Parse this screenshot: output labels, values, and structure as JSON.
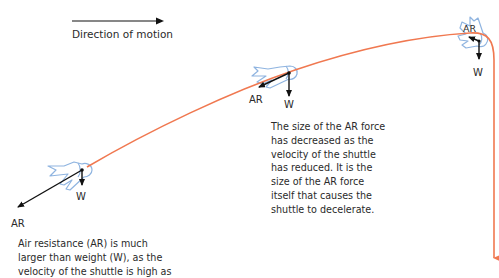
{
  "legend": {
    "direction_label": "Direction of motion"
  },
  "colors": {
    "trajectory": "#f07850",
    "shuttle_outline": "#8fb4e0",
    "force_arrow": "#111111",
    "text": "#2a2a2a"
  },
  "shuttles": [
    {
      "position": "start",
      "ar_label": "AR",
      "w_label": "W",
      "ar_size": "large"
    },
    {
      "position": "middle",
      "ar_label": "AR",
      "w_label": "W",
      "ar_size": "medium"
    },
    {
      "position": "apex",
      "ar_label": "AR",
      "w_label": "W",
      "ar_size": "small"
    }
  ],
  "annotations": {
    "middle": {
      "lines": [
        "The size of the AR force",
        "has decreased as the",
        "velocity of the shuttle",
        "has reduced. It is the",
        "size of the AR force",
        "itself that causes the",
        "shuttle to decelerate."
      ]
    },
    "start": {
      "lines": [
        "Air resistance (AR) is much",
        "larger than weight (W), as the",
        "velocity of the shuttle is high as"
      ]
    }
  }
}
